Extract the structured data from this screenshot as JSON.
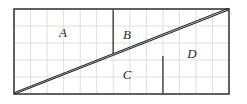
{
  "figure": {
    "background_color": "#ffffff",
    "border_color": "#3a3a3a",
    "grid_color": "#d8d8d8",
    "divider_color": "#4a4a4a",
    "diagonal_color": "#2a2a2a",
    "label_color": "#2b2b2b"
  },
  "grid": {
    "columns": 13,
    "rows": 5,
    "cell_width": 16.54,
    "cell_height": 17.0,
    "origin_x": 14,
    "origin_y": 9,
    "width": 215,
    "height": 85,
    "visible": true
  },
  "outer_rectangle": {
    "x": 14,
    "y": 9,
    "width": 215,
    "height": 85
  },
  "diagonal": {
    "from_x": 14,
    "from_y": 94,
    "to_x": 229,
    "to_y": 9,
    "style": "double-line",
    "stroke_width": 1.1,
    "gap": 1.9
  },
  "dividers": [
    {
      "name": "divider-a-b",
      "x": 113,
      "y_top": 9,
      "y_bottom": 54
    },
    {
      "name": "divider-c-d",
      "x": 163,
      "y_top": 56,
      "y_bottom": 94
    }
  ],
  "pieces": [
    {
      "id": "A",
      "label": "A",
      "x": 63,
      "y": 37
    },
    {
      "id": "B",
      "label": "B",
      "x": 127,
      "y": 39
    },
    {
      "id": "C",
      "label": "C",
      "x": 127,
      "y": 79
    },
    {
      "id": "D",
      "label": "D",
      "x": 192,
      "y": 58
    }
  ]
}
